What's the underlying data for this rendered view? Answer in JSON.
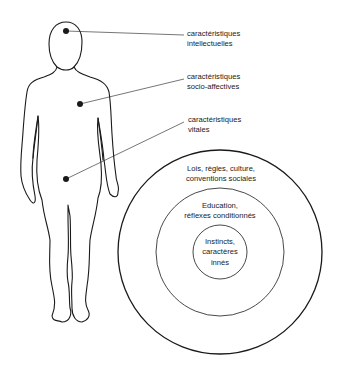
{
  "figure": {
    "person": "human-body-outline",
    "points": [
      {
        "id": "head",
        "label_lines": [
          "caractéristiques",
          "intellectuelles"
        ]
      },
      {
        "id": "chest",
        "label_lines": [
          "caractéristiques",
          "socio-affectives"
        ]
      },
      {
        "id": "abdomen",
        "label_lines": [
          "caractéristiques",
          "vitales"
        ]
      }
    ]
  },
  "circles": {
    "outer": {
      "lines": [
        "Lois, règles, culture,",
        "conventions sociales"
      ]
    },
    "middle": {
      "lines": [
        "Education,",
        "réflexes conditionnés"
      ]
    },
    "inner": {
      "lines": [
        "Instincts,",
        "caractères",
        "innés"
      ]
    }
  },
  "colors": {
    "ink": "#1a1a1a",
    "background": "#ffffff"
  }
}
